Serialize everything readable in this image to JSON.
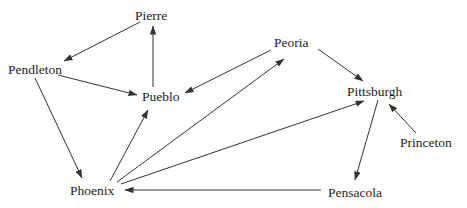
{
  "diagram": {
    "type": "directed-graph",
    "background_color": "#ffffff",
    "edge_color": "#333333",
    "text_color": "#1c1c1c",
    "nodes": [
      {
        "id": "pierre",
        "label": "Pierre",
        "left": 135,
        "top": 9
      },
      {
        "id": "pendleton",
        "label": "Pendleton",
        "left": 8,
        "top": 63
      },
      {
        "id": "peoria",
        "label": "Peoria",
        "left": 274,
        "top": 36
      },
      {
        "id": "pueblo",
        "label": "Pueblo",
        "left": 142,
        "top": 90
      },
      {
        "id": "pittsburgh",
        "label": "Pittsburgh",
        "left": 347,
        "top": 85
      },
      {
        "id": "princeton",
        "label": "Princeton",
        "left": 400,
        "top": 136
      },
      {
        "id": "phoenix",
        "label": "Phoenix",
        "left": 70,
        "top": 184
      },
      {
        "id": "pensacola",
        "label": "Pensacola",
        "left": 328,
        "top": 186
      }
    ],
    "edges": [
      {
        "from": "pierre",
        "to": "pendleton",
        "x1": 140,
        "y1": 22,
        "x2": 64,
        "y2": 61
      },
      {
        "from": "pueblo",
        "to": "pierre",
        "x1": 153,
        "y1": 87,
        "x2": 153,
        "y2": 26
      },
      {
        "from": "pendleton",
        "to": "pueblo",
        "x1": 58,
        "y1": 75,
        "x2": 137,
        "y2": 95
      },
      {
        "from": "pendleton",
        "to": "phoenix",
        "x1": 35,
        "y1": 78,
        "x2": 82,
        "y2": 178
      },
      {
        "from": "peoria",
        "to": "pueblo",
        "x1": 271,
        "y1": 50,
        "x2": 185,
        "y2": 93
      },
      {
        "from": "phoenix",
        "to": "pueblo",
        "x1": 110,
        "y1": 181,
        "x2": 148,
        "y2": 110
      },
      {
        "from": "phoenix",
        "to": "peoria",
        "x1": 117,
        "y1": 182,
        "x2": 284,
        "y2": 59
      },
      {
        "from": "phoenix",
        "to": "pittsburgh",
        "x1": 121,
        "y1": 184,
        "x2": 364,
        "y2": 101
      },
      {
        "from": "peoria",
        "to": "pittsburgh",
        "x1": 318,
        "y1": 49,
        "x2": 363,
        "y2": 81
      },
      {
        "from": "princeton",
        "to": "pittsburgh",
        "x1": 416,
        "y1": 133,
        "x2": 389,
        "y2": 104
      },
      {
        "from": "pittsburgh",
        "to": "pensacola",
        "x1": 378,
        "y1": 100,
        "x2": 355,
        "y2": 180
      },
      {
        "from": "pensacola",
        "to": "phoenix",
        "x1": 321,
        "y1": 190,
        "x2": 125,
        "y2": 190
      }
    ]
  }
}
